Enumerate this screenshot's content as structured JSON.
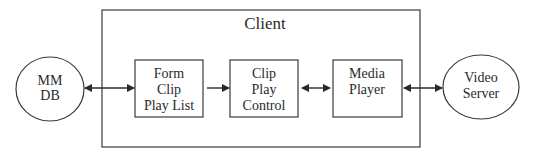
{
  "diagram": {
    "container": {
      "label": "Client"
    },
    "nodes": [
      {
        "id": "mmdb",
        "shape": "ellipse",
        "lines": [
          "MM",
          "DB"
        ]
      },
      {
        "id": "form",
        "shape": "box",
        "lines": [
          "Form",
          "Clip",
          "Play List"
        ]
      },
      {
        "id": "control",
        "shape": "box",
        "lines": [
          "Clip",
          "Play",
          "Control"
        ]
      },
      {
        "id": "player",
        "shape": "box",
        "lines": [
          "Media",
          "Player"
        ]
      },
      {
        "id": "server",
        "shape": "ellipse",
        "lines": [
          "Video",
          "Server"
        ]
      }
    ],
    "edges": [
      {
        "from": "mmdb",
        "to": "form",
        "direction": "both"
      },
      {
        "from": "form",
        "to": "control",
        "direction": "forward"
      },
      {
        "from": "control",
        "to": "player",
        "direction": "both"
      },
      {
        "from": "player",
        "to": "server",
        "direction": "both"
      }
    ],
    "colors": {
      "stroke": "#3a3a3a",
      "text": "#2a2a2a",
      "background": "#ffffff"
    }
  }
}
